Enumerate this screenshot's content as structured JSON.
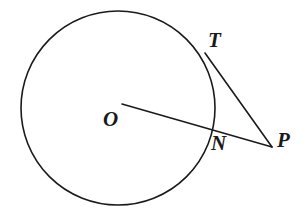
{
  "figure": {
    "background_color": "#ffffff",
    "stroke_color": "#1a1a1a",
    "label_color": "#1a1a1a",
    "stroke_width": 1.6,
    "width": 307,
    "height": 216
  },
  "circle": {
    "name": "circle-O",
    "center_x": 118,
    "center_y": 108,
    "radius": 97,
    "fill": "none",
    "stroke": "#1a1a1a"
  },
  "points": {
    "O": {
      "label": "O",
      "x": 118,
      "y": 108,
      "role": "center"
    },
    "T": {
      "label": "T",
      "x": 206,
      "y": 54,
      "role": "tangent-point"
    },
    "N": {
      "label": "N",
      "x": 212,
      "y": 130,
      "role": "secant-intersection"
    },
    "P": {
      "label": "P",
      "x": 272,
      "y": 147,
      "role": "external-point"
    }
  },
  "segments": [
    {
      "name": "segment-OP",
      "from": "O",
      "to": "P",
      "x1": 122,
      "y1": 104,
      "x2": 272,
      "y2": 147
    },
    {
      "name": "segment-TP",
      "from": "T",
      "to": "P",
      "x1": 205,
      "y1": 53,
      "x2": 272,
      "y2": 147
    }
  ],
  "labels": {
    "O": "O",
    "T": "T",
    "N": "N",
    "P": "P"
  }
}
